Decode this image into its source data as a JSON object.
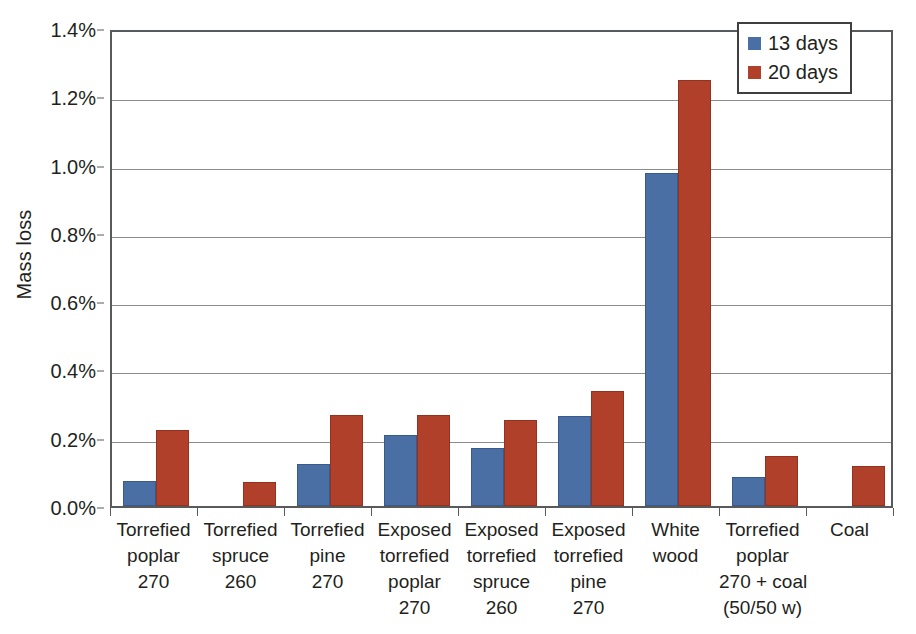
{
  "chart_data": {
    "type": "bar",
    "title": "",
    "xlabel": "",
    "ylabel": "Mass loss",
    "ylim": [
      0,
      1.4
    ],
    "ytick_values": [
      0.0,
      0.2,
      0.4,
      0.6,
      0.8,
      1.0,
      1.2,
      1.4
    ],
    "ytick_labels": [
      "0.0%",
      "0.2%",
      "0.4%",
      "0.6%",
      "0.8%",
      "1.0%",
      "1.2%",
      "1.4%"
    ],
    "grid": "horizontal",
    "legend_position": "top-right",
    "value_unit": "%",
    "categories": [
      "Torrefied poplar 270",
      "Torrefied spruce 260",
      "Torrefied pine 270",
      "Exposed torrefied poplar 270",
      "Exposed torrefied spruce 260",
      "Exposed torrefied pine 270",
      "White wood",
      "Torrefied poplar 270 + coal (50/50 w)",
      "Coal"
    ],
    "category_lines": [
      [
        "Torrefied",
        "poplar",
        "270"
      ],
      [
        "Torrefied",
        "spruce",
        "260"
      ],
      [
        "Torrefied",
        "pine",
        "270"
      ],
      [
        "Exposed",
        "torrefied",
        "poplar",
        "270"
      ],
      [
        "Exposed",
        "torrefied",
        "spruce",
        "260"
      ],
      [
        "Exposed",
        "torrefied",
        "pine",
        "270"
      ],
      [
        "White",
        "wood"
      ],
      [
        "Torrefied",
        "poplar",
        "270 + coal",
        "(50/50 w)"
      ],
      [
        "Coal"
      ]
    ],
    "series": [
      {
        "name": "13 days",
        "color": "#4a6fa5",
        "values": [
          0.073,
          0.0,
          0.124,
          0.208,
          0.17,
          0.263,
          0.976,
          0.085,
          0.0
        ]
      },
      {
        "name": "20 days",
        "color": "#b0402a",
        "values": [
          0.224,
          0.07,
          0.267,
          0.266,
          0.252,
          0.337,
          1.249,
          0.146,
          0.116
        ]
      }
    ]
  },
  "legend": {
    "entries": [
      {
        "label": "13 days",
        "color": "#4a6fa5"
      },
      {
        "label": "20 days",
        "color": "#b0402a"
      }
    ]
  },
  "axis": {
    "y_title": "Mass loss"
  },
  "colors": {
    "series_13_days": "#4a6fa5",
    "series_20_days": "#b0402a",
    "axis": "#58595b",
    "gridline": "#8a8c8e",
    "text": "#231f20",
    "background": "#ffffff"
  }
}
